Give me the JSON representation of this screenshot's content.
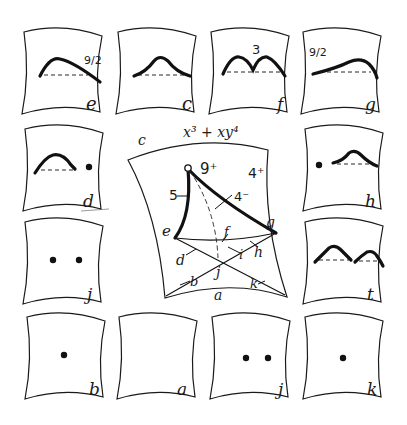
{
  "diagram": {
    "type": "catastrophe-theory bifurcation diagram",
    "center": {
      "formula": "x³ + xy⁴",
      "corner_label": "c",
      "region_labels": {
        "top_vertex": "9⁺",
        "upper_right": "4⁺",
        "left_edge": "5",
        "middle": "4⁻",
        "e": "e",
        "g": "g",
        "f": "f",
        "d": "d",
        "i": "i",
        "h": "h",
        "j": "j",
        "b": "b",
        "k": "k",
        "a": "a"
      }
    },
    "panels": [
      {
        "id": "e",
        "label": "e",
        "annotation": "9/2",
        "content": "one asymmetric hump with long right tail"
      },
      {
        "id": "c",
        "label": "c",
        "annotation": "",
        "content": "one symmetric hump"
      },
      {
        "id": "f",
        "label": "f",
        "annotation": "3",
        "content": "double hump"
      },
      {
        "id": "g",
        "label": "g",
        "annotation": "9/2",
        "content": "one asymmetric hump with long left tail"
      },
      {
        "id": "d",
        "label": "d",
        "annotation": "",
        "content": "hump left, dot right"
      },
      {
        "id": "h",
        "label": "h",
        "annotation": "",
        "content": "dot left, hump right"
      },
      {
        "id": "j-left",
        "label": "j",
        "annotation": "",
        "content": "two dots"
      },
      {
        "id": "t",
        "label": "t",
        "annotation": "",
        "content": "two humps"
      },
      {
        "id": "b",
        "label": "b",
        "annotation": "",
        "content": "one dot"
      },
      {
        "id": "a",
        "label": "a",
        "annotation": "",
        "content": "empty"
      },
      {
        "id": "j-bottom",
        "label": "j",
        "annotation": "",
        "content": "two dots"
      },
      {
        "id": "k",
        "label": "k",
        "annotation": "",
        "content": "one dot"
      }
    ]
  }
}
